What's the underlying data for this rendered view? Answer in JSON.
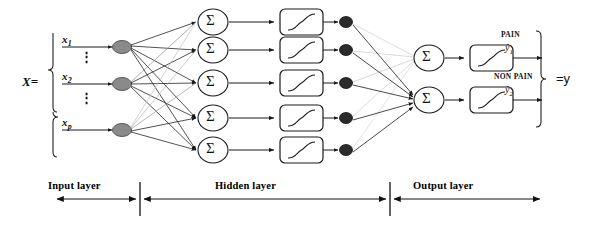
{
  "figure": {
    "type": "neural-network-architecture-diagram",
    "input_block": {
      "equals_label": "X=",
      "variables": [
        {
          "name": "x",
          "subscript": "1"
        },
        {
          "name": "x",
          "subscript": "2"
        },
        {
          "name": "x",
          "subscript": "p"
        }
      ],
      "ellipsis": "⋮",
      "node_count": 3,
      "node_color": "#8a8a8a"
    },
    "hidden_block": {
      "sum_symbol": "Σ",
      "unit_count": 5,
      "activation": "sigmoid",
      "node_color": "#2b2b2b"
    },
    "output_block": {
      "sum_symbol": "Σ",
      "unit_count": 2,
      "activation": "sigmoid",
      "outputs": [
        {
          "class_label": "PAIN",
          "hat_var": "ŷ",
          "subscript": "1"
        },
        {
          "class_label": "NON PAIN",
          "hat_var": "ŷ",
          "subscript": "2"
        }
      ],
      "equals_label": "=y"
    },
    "axis": {
      "layers": [
        {
          "label": "Input layer"
        },
        {
          "label": "Hidden layer"
        },
        {
          "label": "Output layer"
        }
      ]
    },
    "colors": {
      "stroke": "#1a1a1a",
      "faint_edge": "#bdbdbd",
      "input_node": "#8a8a8a",
      "hidden_node": "#2b2b2b",
      "background": "#ffffff"
    }
  }
}
